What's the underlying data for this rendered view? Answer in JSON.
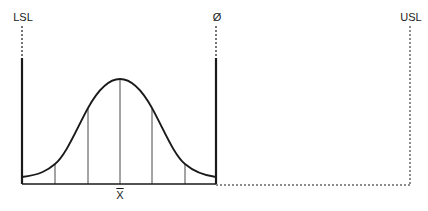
{
  "diagram": {
    "type": "process-capability-normal-distribution",
    "labels": {
      "lsl": "LSL",
      "usl": "USL",
      "diameter": "Ø",
      "mean": "X"
    },
    "colors": {
      "line": "#1a1a1a",
      "background": "#ffffff"
    },
    "elements": [
      {
        "name": "lower-spec-limit",
        "label": "LSL",
        "style": "dashed-then-solid"
      },
      {
        "name": "tolerance-limit",
        "label": "Ø",
        "style": "dashed-then-solid"
      },
      {
        "name": "upper-spec-limit",
        "label": "USL",
        "style": "dotted"
      },
      {
        "name": "bell-curve",
        "divisions": 6
      },
      {
        "name": "mean-marker",
        "label": "X̄"
      }
    ]
  }
}
